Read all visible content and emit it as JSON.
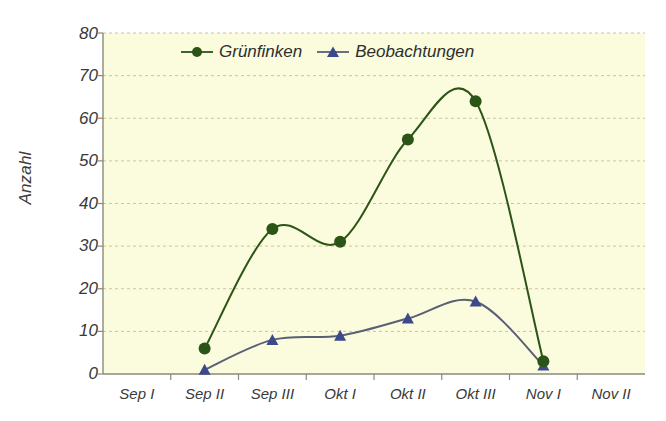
{
  "chart_data": {
    "type": "line",
    "title": "",
    "subtitle": "",
    "xlabel": "",
    "ylabel": "Anzahl",
    "categories": [
      "Sep I",
      "Sep II",
      "Sep III",
      "Okt I",
      "Okt II",
      "Okt III",
      "Nov I",
      "Nov II"
    ],
    "ylim": [
      0,
      80
    ],
    "yticks": [
      0,
      10,
      20,
      30,
      40,
      50,
      60,
      70,
      80
    ],
    "grid": true,
    "grid_style": "dashed-horizontal",
    "legend_position": "top-center-inside",
    "smoothing": "spline",
    "series": [
      {
        "name": "Grünfinken",
        "color": "#2b5417",
        "marker": "circle",
        "values": [
          null,
          6,
          34,
          31,
          55,
          64,
          3,
          null
        ]
      },
      {
        "name": "Beobachtungen",
        "color": "#3c4a8c",
        "line_color": "#5a5f73",
        "marker": "triangle",
        "values": [
          null,
          1,
          8,
          9,
          13,
          17,
          2,
          null
        ]
      }
    ],
    "plot_background": "#fbfbdd",
    "grid_color": "#c9ba8a",
    "axis_color": "#8a8a7a",
    "text_color": "#3a3a3a"
  },
  "axis": {
    "y_title": "Anzahl",
    "y_labels": [
      "80",
      "70",
      "60",
      "50",
      "40",
      "30",
      "20",
      "10",
      "0"
    ],
    "x_labels": [
      "Sep I",
      "Sep II",
      "Sep III",
      "Okt I",
      "Okt II",
      "Okt III",
      "Nov I",
      "Nov II"
    ]
  },
  "legend": {
    "items": [
      {
        "label": "Grünfinken",
        "color": "#2b5417",
        "marker": "circle-marker"
      },
      {
        "label": "Beobachtungen",
        "color": "#3c4a8c",
        "marker": "triangle-marker"
      }
    ]
  }
}
